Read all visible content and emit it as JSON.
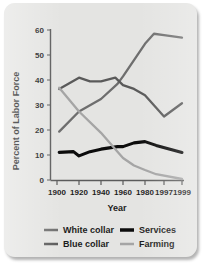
{
  "chart_data": {
    "type": "line",
    "title": "",
    "xlabel": "Year",
    "ylabel": "Percent of Labor Force",
    "x": [
      1900,
      1920,
      1940,
      1960,
      1980,
      1997,
      1999
    ],
    "xticklabels": [
      "1900",
      "1920",
      "1940",
      "1960",
      "1980",
      "1997",
      "1999"
    ],
    "yticklabels": [
      "0",
      "10",
      "20",
      "30",
      "40",
      "50",
      "60"
    ],
    "ylim": [
      0,
      60
    ],
    "ytick_step": 10,
    "grid": false,
    "legend_position": "bottom",
    "series": [
      {
        "name": "White collar",
        "color": "#6e6e6e",
        "x": [
          1902,
          1920,
          1940,
          1955,
          1960,
          1970,
          1980,
          1988,
          1997,
          1999
        ],
        "values": [
          19.5,
          27.5,
          32.5,
          38.5,
          41.5,
          48.0,
          54.5,
          58.5,
          58.0,
          57.0
        ]
      },
      {
        "name": "Blue collar",
        "color": "#5a5a5a",
        "x": [
          1902,
          1920,
          1930,
          1940,
          1953,
          1960,
          1970,
          1980,
          1990,
          1997,
          1999
        ],
        "values": [
          36.5,
          41.0,
          39.5,
          39.5,
          41.0,
          38.0,
          36.5,
          34.0,
          29.0,
          25.5,
          30.8
        ]
      },
      {
        "name": "Services",
        "color": "#0c0c0c",
        "x": [
          1902,
          1915,
          1920,
          1930,
          1940,
          1955,
          1960,
          1970,
          1980,
          1990,
          1999
        ],
        "values": [
          11.2,
          11.5,
          9.8,
          11.5,
          12.5,
          13.5,
          13.5,
          15.0,
          15.5,
          14.0,
          11.2
        ]
      },
      {
        "name": "Farming",
        "color": "#a5a5a5",
        "x": [
          1902,
          1920,
          1940,
          1955,
          1960,
          1970,
          1980,
          1990,
          1999
        ],
        "values": [
          37.0,
          27.5,
          19.0,
          11.5,
          9.0,
          6.0,
          4.2,
          2.5,
          0.6
        ]
      }
    ]
  },
  "legend": {
    "items": [
      {
        "label": "White collar",
        "color": "#6e6e6e",
        "thickness": 2.6
      },
      {
        "label": "Services",
        "color": "#0c0c0c",
        "thickness": 3.6
      },
      {
        "label": "Blue collar",
        "color": "#5a5a5a",
        "thickness": 2.6
      },
      {
        "label": "Farming",
        "color": "#a5a5a5",
        "thickness": 2.6
      }
    ]
  }
}
